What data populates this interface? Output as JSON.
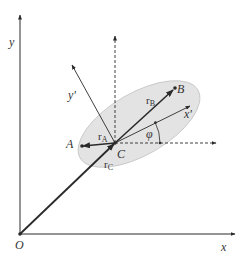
{
  "diagram": {
    "colors": {
      "ink": "#2a2a2a",
      "ellipse_fill": "#e3e3e3",
      "ellipse_stroke": "#bdbdbd",
      "label": "#333333"
    },
    "labels": {
      "origin": "O",
      "x_axis": "x",
      "y_axis": "y",
      "x_prime": "x'",
      "y_prime": "y'",
      "point_a": "A",
      "point_b": "B",
      "point_c": "C",
      "r_a_base": "r",
      "r_a_sub": "A",
      "r_b_base": "r",
      "r_b_sub": "B",
      "r_c_base": "r",
      "r_c_sub": "C",
      "angle": "φ"
    }
  }
}
